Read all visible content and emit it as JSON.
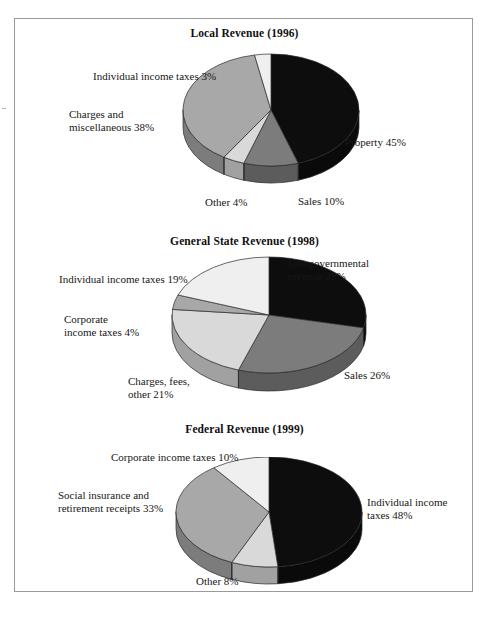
{
  "figure": {
    "background": "#ffffff",
    "frame_color": "#9a9a9a",
    "text_color": "#171717"
  },
  "palette": {
    "black": "#0d0d0d",
    "dark_gray": "#7c7c7c",
    "mid_gray": "#a8a8a8",
    "light_gray": "#d9d9d9",
    "pale_gray": "#efefef",
    "side_black": "#060606",
    "side_dark_gray": "#5d5d5d",
    "side_mid_gray": "#7f7f7f",
    "side_light_gray": "#a9a9a9",
    "side_pale_gray": "#bcbcbc",
    "edge": "#2a2a2a"
  },
  "chart_data": [
    {
      "type": "pie",
      "id": "local-revenue",
      "title": "Local Revenue (1996)",
      "categories": [
        "Property",
        "Sales",
        "Other",
        "Charges and miscellaneous",
        "Individual income taxes"
      ],
      "values": [
        45,
        10,
        4,
        38,
        3
      ],
      "unit": "%",
      "labels": [
        "Property 45%",
        "Sales 10%",
        "Other 4%",
        "Charges and\nmiscellaneous 38%",
        "Individual income taxes 3%"
      ],
      "colors": [
        "#0d0d0d",
        "#7c7c7c",
        "#d9d9d9",
        "#a8a8a8",
        "#efefef"
      ],
      "legend": "none",
      "grid": false
    },
    {
      "type": "pie",
      "id": "general-state-revenue",
      "title": "General State Revenue (1998)",
      "categories": [
        "Intergovernmental revenue",
        "Sales",
        "Charges, fees, other",
        "Corporate income taxes",
        "Individual income taxes"
      ],
      "values": [
        28,
        26,
        21,
        4,
        19
      ],
      "unit": "%",
      "labels": [
        "Intergovernmental\nrevenue 28%",
        "Sales 26%",
        "Charges, fees,\nother 21%",
        "Corporate\nincome taxes 4%",
        "Individual income taxes 19%"
      ],
      "colors": [
        "#0d0d0d",
        "#7c7c7c",
        "#d9d9d9",
        "#a8a8a8",
        "#efefef"
      ],
      "legend": "none",
      "grid": false
    },
    {
      "type": "pie",
      "id": "federal-revenue",
      "title": "Federal Revenue (1999)",
      "categories": [
        "Individual income taxes",
        "Other",
        "Social insurance and retirement receipts",
        "Corporate income taxes"
      ],
      "values": [
        48,
        8,
        33,
        10
      ],
      "unit": "%",
      "labels": [
        "Individual income\ntaxes 48%",
        "Other 8%",
        "Social insurance and\nretirement receipts 33%",
        "Corporate income taxes 10%"
      ],
      "colors": [
        "#0d0d0d",
        "#d9d9d9",
        "#a8a8a8",
        "#efefef"
      ],
      "legend": "none",
      "grid": false
    }
  ],
  "charts": {
    "local": {
      "title": "Local Revenue (1996)",
      "label_property": "Property 45%",
      "label_sales": "Sales 10%",
      "label_other": "Other 4%",
      "label_charges_l1": "Charges and",
      "label_charges_l2": "miscellaneous 38%",
      "label_individual": "Individual income taxes 3%"
    },
    "state": {
      "title": "General State Revenue (1998)",
      "label_inter_l1": "Intergovernmental",
      "label_inter_l2": "revenue 28%",
      "label_sales": "Sales 26%",
      "label_charges_l1": "Charges, fees,",
      "label_charges_l2": "other 21%",
      "label_corporate_l1": "Corporate",
      "label_corporate_l2": "income taxes 4%",
      "label_individual": "Individual income taxes 19%"
    },
    "federal": {
      "title": "Federal Revenue (1999)",
      "label_individual_l1": "Individual income",
      "label_individual_l2": "taxes 48%",
      "label_other": "Other 8%",
      "label_social_l1": "Social insurance and",
      "label_social_l2": "retirement receipts 33%",
      "label_corporate": "Corporate income taxes 10%"
    }
  }
}
